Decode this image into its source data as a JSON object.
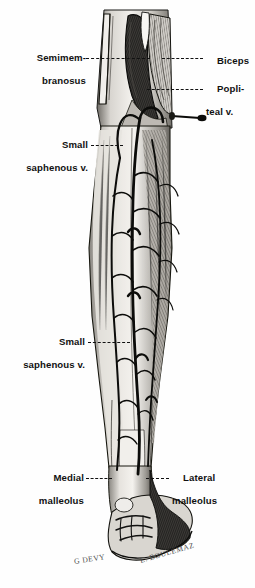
{
  "figure": {
    "background_color": "#ffffff",
    "ink_color": "#111111"
  },
  "labels": [
    {
      "id": "semimembranosus",
      "name": "semimembranosus",
      "line1": "Semimem-",
      "line2": "branosus",
      "side": "left"
    },
    {
      "id": "biceps",
      "name": "biceps",
      "line1": "Biceps",
      "line2": "",
      "side": "right"
    },
    {
      "id": "popliteal-vein",
      "name": "popliteal-vein",
      "line1": "Popli-",
      "line2": "teal v.",
      "side": "right"
    },
    {
      "id": "small-saphenous-upper",
      "name": "small-saphenous-vein-upper",
      "line1": "Small",
      "line2": "saphenous v.",
      "side": "left"
    },
    {
      "id": "small-saphenous-lower",
      "name": "small-saphenous-vein-lower",
      "line1": "Small",
      "line2": "saphenous v.",
      "side": "left"
    },
    {
      "id": "medial-malleolus",
      "name": "medial-malleolus",
      "line1": "Medial",
      "line2": "malleolus",
      "side": "left"
    },
    {
      "id": "lateral-malleolus",
      "name": "lateral-malleolus",
      "line1": "Lateral",
      "line2": "malleolus",
      "side": "right"
    }
  ],
  "signatures": {
    "artist_left": "G DEVY",
    "artist_right": "E. BOULEMAZ"
  }
}
